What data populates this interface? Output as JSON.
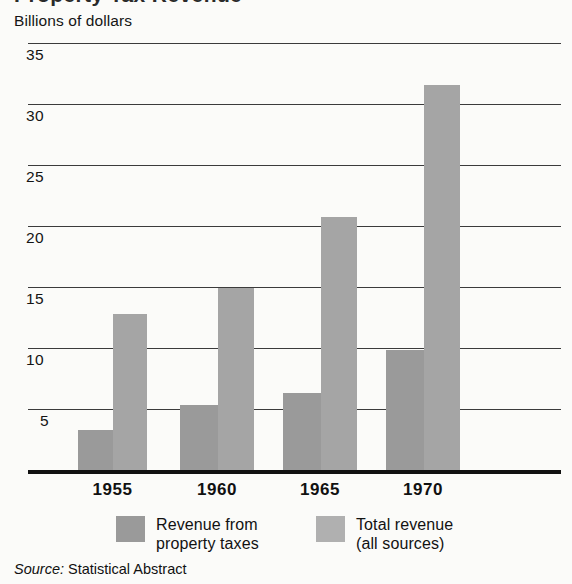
{
  "title_partial": "Property Tax Revenue",
  "axis_caption": "Billions of dollars",
  "source": {
    "label": "Source:",
    "value": " Statistical Abstract"
  },
  "legend": [
    {
      "key": "prop",
      "label": "Revenue from\nproperty taxes",
      "color": "#9a9a9a"
    },
    {
      "key": "total",
      "label": "Total revenue\n(all sources)",
      "color": "#b0b0b0"
    }
  ],
  "yticks": [
    "35",
    "30",
    "25",
    "20",
    "15",
    "10",
    "5"
  ],
  "xticks": [
    "1955",
    "1960",
    "1965",
    "1970"
  ],
  "chart_data": {
    "type": "bar",
    "title": "Property Tax Revenue",
    "subtitle": "Billions of dollars",
    "xlabel": "",
    "ylabel": "Billions of dollars",
    "categories": [
      "1955",
      "1960",
      "1965",
      "1970"
    ],
    "series": [
      {
        "name": "Revenue from property taxes",
        "color": "#9a9a9a",
        "values": [
          3.4,
          5.4,
          6.4,
          9.9
        ]
      },
      {
        "name": "Total revenue (all sources)",
        "color": "#a5a5a5",
        "values": [
          12.9,
          15.0,
          20.8,
          31.6
        ]
      }
    ],
    "ylim": [
      0,
      35
    ],
    "ytick_values": [
      5,
      10,
      15,
      20,
      25,
      30,
      35
    ],
    "grid": true,
    "legend_position": "bottom",
    "source": "Source: Statistical Abstract",
    "units": "Billions of dollars"
  }
}
